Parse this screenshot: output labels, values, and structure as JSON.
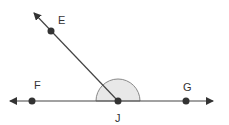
{
  "diagram": {
    "type": "geometry-angle",
    "colors": {
      "line": "#444444",
      "point": "#333333",
      "arc_fill": "#e8e8e8",
      "arc_stroke": "#888888"
    },
    "points": [
      {
        "label": "E",
        "x": 51,
        "y": 31,
        "label_x": 58,
        "label_y": 24
      },
      {
        "label": "F",
        "x": 32,
        "y": 101,
        "label_x": 34,
        "label_y": 89
      },
      {
        "label": "J",
        "x": 118,
        "y": 101,
        "label_x": 115,
        "label_y": 122
      },
      {
        "label": "G",
        "x": 186,
        "y": 101,
        "label_x": 183,
        "label_y": 91
      }
    ],
    "line": {
      "from": "F",
      "to": "G",
      "x1": 10,
      "x2": 213,
      "y": 101,
      "arrows": "both"
    },
    "ray": {
      "from": "J",
      "through": "E",
      "tip_x": 34,
      "tip_y": 13
    },
    "arc": {
      "center": "J",
      "radius": 22,
      "angle": "semicircle"
    }
  }
}
